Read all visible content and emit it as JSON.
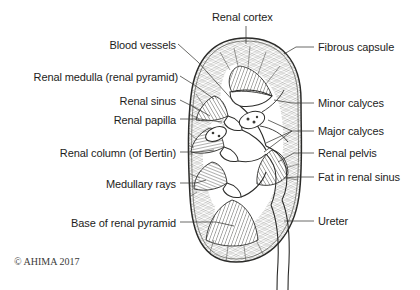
{
  "figure": {
    "copyright": "© AHIMA 2017",
    "ink_color": "#2b2b29",
    "text_color": "#1d1d1b",
    "background": "#ffffff",
    "width": 420,
    "height": 290
  },
  "labels": {
    "renal_cortex": "Renal cortex",
    "blood_vessels": "Blood vessels",
    "renal_medulla": "Renal medulla (renal pyramid)",
    "renal_sinus": "Renal sinus",
    "renal_papilla": "Renal papilla",
    "renal_column": "Renal column (of Bertin)",
    "medullary_rays": "Medullary rays",
    "base_of_renal_pyramid": "Base of renal pyramid",
    "fibrous_capsule": "Fibrous capsule",
    "minor_calyces": "Minor calyces",
    "major_calyces": "Major calyces",
    "renal_pelvis": "Renal pelvis",
    "fat_in_renal_sinus": "Fat in renal sinus",
    "ureter": "Ureter"
  }
}
